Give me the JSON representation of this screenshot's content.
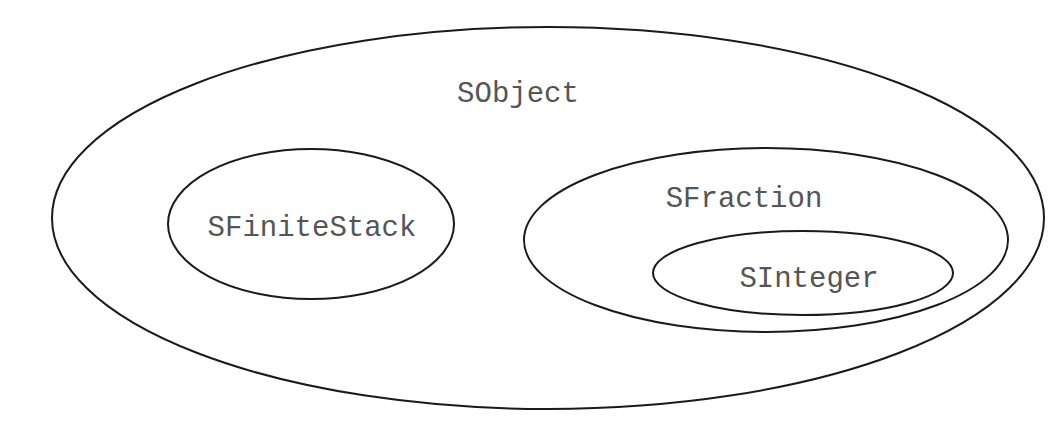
{
  "diagram": {
    "type": "euler-set-containment",
    "sets": [
      {
        "id": "sobject",
        "label": "SObject",
        "parent": null
      },
      {
        "id": "sfinitestack",
        "label": "SFiniteStack",
        "parent": "sobject"
      },
      {
        "id": "sfraction",
        "label": "SFraction",
        "parent": "sobject"
      },
      {
        "id": "sinteger",
        "label": "SInteger",
        "parent": "sfraction"
      }
    ],
    "colors": {
      "outline": "#1a1a1a",
      "label": "#555555",
      "background": "#ffffff"
    }
  }
}
